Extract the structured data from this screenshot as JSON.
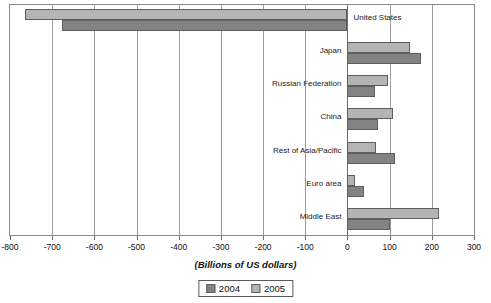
{
  "chart_data": {
    "type": "bar",
    "orientation": "horizontal",
    "title": "",
    "xlabel": "(Billions of US dollars)",
    "ylabel": "",
    "xlim": [
      -800,
      300
    ],
    "xticks": [
      -800,
      -700,
      -600,
      -500,
      -400,
      -300,
      -200,
      -100,
      0,
      100,
      200,
      300
    ],
    "xtick_labels": [
      "-800",
      "-700",
      "-600",
      "-500",
      "-400",
      "-300",
      "-200",
      "-100",
      "0",
      "100",
      "200",
      "300"
    ],
    "grid": true,
    "legend_position": "bottom-center",
    "categories": [
      "United States",
      "Japan",
      "Russian Federation",
      "China",
      "Rest of Asia/Pacific",
      "Euro area",
      "Middle East"
    ],
    "series": [
      {
        "name": "2004",
        "color": "#838383",
        "values": [
          -677,
          174,
          65,
          72,
          113,
          40,
          100
        ]
      },
      {
        "name": "2005",
        "color": "#b4b4b4",
        "values": [
          -765,
          149,
          95,
          107,
          68,
          18,
          216
        ]
      }
    ]
  },
  "legend": {
    "items": [
      {
        "label": "2004",
        "swatch": "dark-gray-swatch"
      },
      {
        "label": "2005",
        "swatch": "light-gray-swatch"
      }
    ]
  }
}
